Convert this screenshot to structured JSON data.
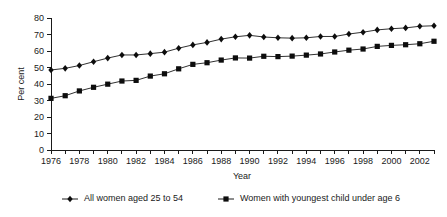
{
  "chart_data": {
    "type": "line",
    "title": "",
    "subtitle": "",
    "xlabel": "Year",
    "ylabel": "Per cent",
    "xlim": [
      1976,
      2003
    ],
    "ylim": [
      0,
      80
    ],
    "grid": false,
    "legend_position": "bottom",
    "x": [
      1976,
      1977,
      1978,
      1979,
      1980,
      1981,
      1982,
      1983,
      1984,
      1985,
      1986,
      1987,
      1988,
      1989,
      1990,
      1991,
      1992,
      1993,
      1994,
      1995,
      1996,
      1997,
      1998,
      1999,
      2000,
      2001,
      2002,
      2003
    ],
    "xtick_values": [
      1976,
      1977,
      1978,
      1979,
      1980,
      1981,
      1982,
      1983,
      1984,
      1985,
      1986,
      1987,
      1988,
      1989,
      1990,
      1991,
      1992,
      1993,
      1994,
      1995,
      1996,
      1997,
      1998,
      1999,
      2000,
      2001,
      2002,
      2003
    ],
    "xtick_labels": [
      "1976",
      "",
      "1978",
      "",
      "1980",
      "",
      "1982",
      "",
      "1984",
      "",
      "1986",
      "",
      "1988",
      "",
      "1990",
      "",
      "1992",
      "",
      "1994",
      "",
      "1996",
      "",
      "1998",
      "",
      "2000",
      "",
      "2002",
      ""
    ],
    "ytick_values": [
      0,
      10,
      20,
      30,
      40,
      50,
      60,
      70,
      80
    ],
    "ytick_labels": [
      "0",
      "10",
      "20",
      "30",
      "40",
      "50",
      "60",
      "70",
      "80"
    ],
    "series": [
      {
        "name": "All women aged 25 to 54",
        "marker": "diamond",
        "color": "#0d0d0d",
        "values": [
          48.5,
          49.5,
          51.2,
          53.5,
          55.7,
          57.6,
          57.6,
          58.4,
          59.3,
          61.7,
          63.7,
          65.2,
          67.2,
          68.6,
          69.5,
          68.5,
          68.0,
          67.8,
          68.0,
          68.8,
          68.8,
          70.3,
          71.4,
          72.8,
          73.5,
          74.0,
          75.0,
          75.3
        ]
      },
      {
        "name": "Women with youngest child under age 6",
        "marker": "square",
        "color": "#0d0d0d",
        "values": [
          31.3,
          32.9,
          35.8,
          38.0,
          39.9,
          41.8,
          42.2,
          44.8,
          46.2,
          49.2,
          51.9,
          52.9,
          54.5,
          55.8,
          55.7,
          56.8,
          56.6,
          56.9,
          57.5,
          58.2,
          59.4,
          60.5,
          61.2,
          62.8,
          63.4,
          63.8,
          64.4,
          65.9
        ]
      }
    ],
    "annotations": []
  },
  "legend": {
    "entries": [
      {
        "label": "All women aged 25 to 54",
        "marker": "diamond"
      },
      {
        "label": "Women with youngest child under age 6",
        "marker": "square"
      }
    ]
  }
}
